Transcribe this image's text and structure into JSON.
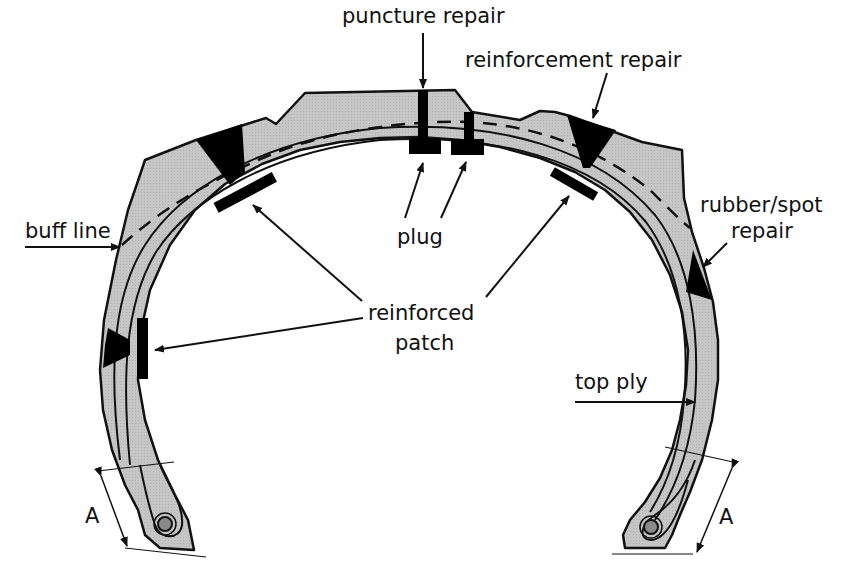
{
  "diagram": {
    "colors": {
      "rubber_fill": "#c4c4c4",
      "outline": "#111111",
      "repair_fill": "#000000",
      "bead_core": "#8a8a8a",
      "background": "#ffffff"
    },
    "labels": {
      "puncture_repair": "puncture repair",
      "reinforcement_repair": "reinforcement repair",
      "buff_line": "buff line",
      "plug": "plug",
      "rubber_spot_repair_line1": "rubber/spot",
      "rubber_spot_repair_line2": "repair",
      "reinforced_patch_line1": "reinforced",
      "reinforced_patch_line2": "patch",
      "top_ply": "top ply",
      "dimension_left": "A",
      "dimension_right": "A"
    }
  }
}
